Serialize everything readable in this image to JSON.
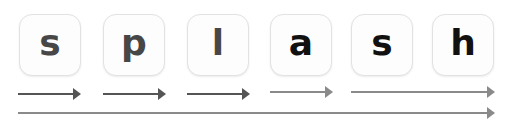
{
  "word": "splash",
  "letters": [
    {
      "char": "s",
      "color": "#474747",
      "x": 19
    },
    {
      "char": "p",
      "color": "#474747",
      "x": 103
    },
    {
      "char": "l",
      "color": "#474747",
      "x": 187
    },
    {
      "char": "a",
      "color": "#111111",
      "x": 270
    },
    {
      "char": "s",
      "color": "#111111",
      "x": 351
    },
    {
      "char": "h",
      "color": "#111111",
      "x": 432
    }
  ],
  "arrows": [
    {
      "x": 18,
      "y": 93,
      "w": 63,
      "color": "#555555"
    },
    {
      "x": 103,
      "y": 93,
      "w": 63,
      "color": "#555555"
    },
    {
      "x": 187,
      "y": 93,
      "w": 63,
      "color": "#555555"
    },
    {
      "x": 270,
      "y": 91,
      "w": 63,
      "color": "#8a8a8a"
    },
    {
      "x": 351,
      "y": 91,
      "w": 144,
      "color": "#8a8a8a"
    },
    {
      "x": 18,
      "y": 112,
      "w": 477,
      "color": "#8a8a8a"
    }
  ]
}
